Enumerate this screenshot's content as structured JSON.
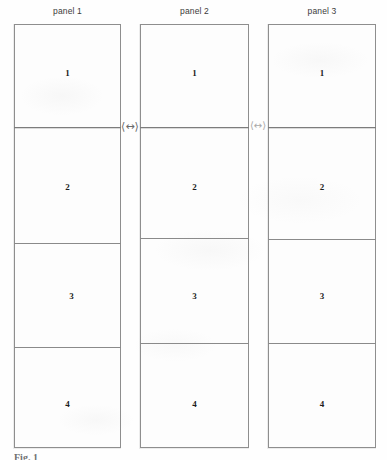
{
  "figure": {
    "caption": "Fig. 1",
    "panel_count": 3,
    "rows_per_panel": 4,
    "line_color": "#8a8a8a",
    "background_color": "#fefefe",
    "text_color": "#1d1d1d"
  },
  "panels": [
    {
      "title": "panel 1",
      "cells": [
        {
          "label": "1"
        },
        {
          "label": "2"
        },
        {
          "label": "3"
        },
        {
          "label": "4"
        }
      ]
    },
    {
      "title": "panel 2",
      "cells": [
        {
          "label": "1"
        },
        {
          "label": "2"
        },
        {
          "label": "3"
        },
        {
          "label": "4"
        }
      ]
    },
    {
      "title": "panel 3",
      "cells": [
        {
          "label": "1"
        },
        {
          "label": "2"
        },
        {
          "label": "3"
        },
        {
          "label": "4"
        }
      ]
    }
  ],
  "gap_markers": [
    {
      "glyph": "⟨↔⟩",
      "name": "double-headed-arrow-icon"
    },
    {
      "glyph": "⟨↔⟩",
      "name": "double-headed-arrow-icon"
    }
  ]
}
